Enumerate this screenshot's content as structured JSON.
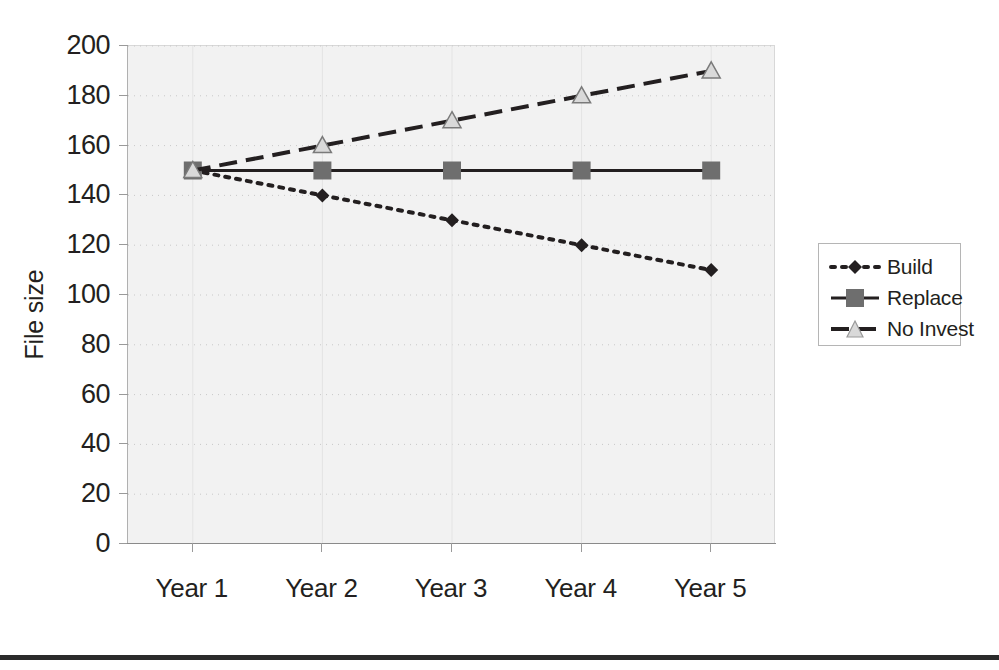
{
  "chart_data": {
    "type": "line",
    "title": "",
    "xlabel": "",
    "ylabel": "File size",
    "categories": [
      "Year 1",
      "Year 2",
      "Year 3",
      "Year 4",
      "Year 5"
    ],
    "ylim": [
      0,
      200
    ],
    "yticks": [
      0,
      20,
      40,
      60,
      80,
      100,
      120,
      140,
      160,
      180,
      200
    ],
    "ytick_labels": [
      "0",
      "20",
      "40",
      "60",
      "80",
      "100",
      "120",
      "140",
      "160",
      "180",
      "200"
    ],
    "grid": "horizontal-dotted",
    "legend_position": "right",
    "series": [
      {
        "name": "Build",
        "values": [
          150,
          140,
          130,
          120,
          110
        ],
        "line_style": "dotted",
        "marker": "diamond",
        "color": "#231f20"
      },
      {
        "name": "Replace",
        "values": [
          150,
          150,
          150,
          150,
          150
        ],
        "line_style": "solid",
        "marker": "square",
        "color": "#231f20",
        "marker_color": "#6e6e6e"
      },
      {
        "name": "No Invest",
        "values": [
          150,
          160,
          170,
          180,
          190
        ],
        "line_style": "dashed",
        "marker": "triangle",
        "color": "#231f20"
      }
    ]
  },
  "legend": {
    "items": [
      {
        "label": "Build"
      },
      {
        "label": "Replace"
      },
      {
        "label": "No Invest"
      }
    ]
  },
  "colors": {
    "plot_background": "#f2f2f2",
    "axis": "#8a8a8a",
    "gridline": "#c8c8c8",
    "text": "#231f20",
    "marker_fill": "#6e6e6e",
    "bottom_rule": "#2b2b2b"
  }
}
